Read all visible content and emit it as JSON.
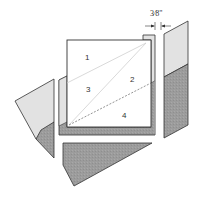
{
  "diagram": {
    "type": "quilt-block-construction",
    "dimension_label": "3⁄8\"",
    "section_labels": [
      {
        "id": "1",
        "text": "1"
      },
      {
        "id": "2",
        "text": "2"
      },
      {
        "id": "3",
        "text": "3"
      },
      {
        "id": "4",
        "text": "4"
      }
    ],
    "colors": {
      "light_fabric": "#e2e2e2",
      "dark_fabric": "#9a9a9a",
      "paper": "#ffffff",
      "outline": "#333333",
      "seam_line": "#cfcfcf"
    }
  }
}
